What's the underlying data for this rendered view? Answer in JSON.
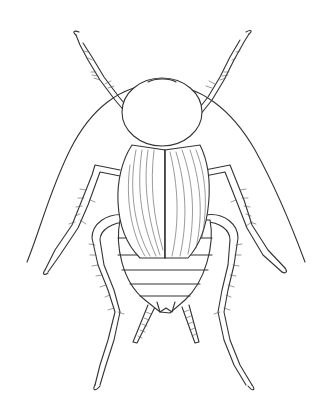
{
  "illustration": {
    "subject": "cockroach",
    "view": "dorsal",
    "style": "black-and-white line drawing",
    "colors": {
      "background": "#ffffff",
      "ink": "#333333"
    }
  }
}
